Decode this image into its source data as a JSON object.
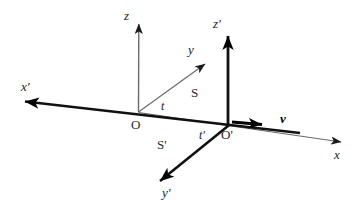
{
  "figure": {
    "kind": "relativity-reference-frames-diagram",
    "background_color": "#ffffff",
    "ink_color": "#1a1a1a",
    "bold_ink_color": "#000000",
    "thin_ink_color": "#555555",
    "width": 364,
    "height": 208
  },
  "labels": {
    "z": "z",
    "z_prime": "z'",
    "y": "y",
    "y_prime": "y'",
    "x": "x",
    "x_prime": "x'",
    "origin": "O",
    "origin_prime": "O'",
    "frame_s": "S",
    "frame_s_prime": "S'",
    "time_t": "t",
    "time_t_prime": "t'",
    "velocity": "v"
  },
  "geometry": {
    "origin": {
      "x": 138,
      "y": 112
    },
    "origin_prime": {
      "x": 228,
      "y": 126
    },
    "z_tip": {
      "x": 139,
      "y": 14
    },
    "z_prime_tip": {
      "x": 228,
      "y": 26
    },
    "y_tip": {
      "x": 214,
      "y": 57
    },
    "y_prime_tip": {
      "x": 151,
      "y": 188
    },
    "x_tip": {
      "x": 351,
      "y": 143
    },
    "x_prime_tip": {
      "x": 14,
      "y": 102
    },
    "velocity_tail": {
      "x": 232,
      "y": 122
    },
    "velocity_tip": {
      "x": 272,
      "y": 125
    }
  }
}
